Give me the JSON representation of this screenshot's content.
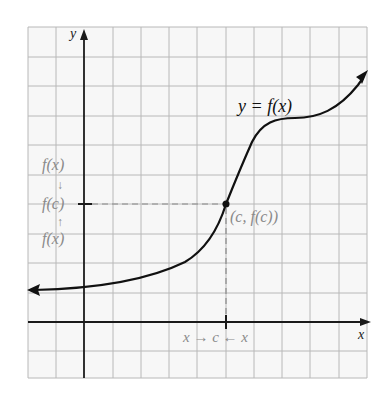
{
  "diagram": {
    "axes": {
      "x_label": "x",
      "y_label": "y"
    },
    "curve_label": "y = f(x)",
    "point_label": "(c, f(c))",
    "x_annotation": "x → c ← x",
    "y_annotation": {
      "top": "f(x)",
      "middle": "f(c)",
      "bottom": "f(x)",
      "arrow_down": "↓",
      "arrow_up": "↑"
    },
    "colors": {
      "grid": "#b5b5b5",
      "axis": "#1a1a1a",
      "curve": "#111111",
      "annotation": "#8a8a8a",
      "dashed": "#888888",
      "background": "#f7f7f7"
    },
    "grid": {
      "columns": 12,
      "rows": 12,
      "cell_px": 28.3
    }
  }
}
